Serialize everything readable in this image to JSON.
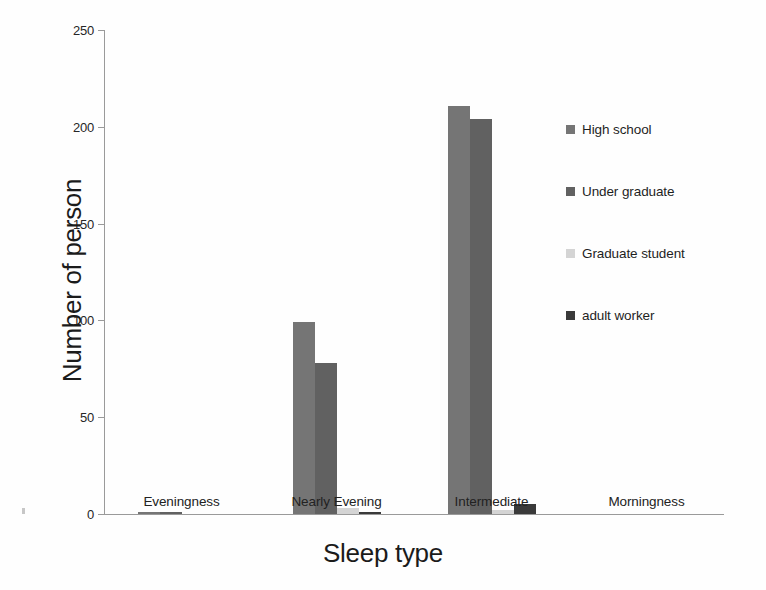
{
  "chart_data": {
    "type": "bar",
    "title": "",
    "xlabel": "Sleep type",
    "ylabel": "Number of person",
    "ylim": [
      0,
      250
    ],
    "yticks": [
      0,
      50,
      100,
      150,
      200,
      250
    ],
    "grid": false,
    "legend_position": "right",
    "categories": [
      "Eveningness",
      "Nearly Evening",
      "Intermediate",
      "Morningness"
    ],
    "series": [
      {
        "name": "High school",
        "color": "#757575",
        "values": [
          1,
          99,
          211,
          0
        ]
      },
      {
        "name": "Under graduate",
        "color": "#616161",
        "values": [
          1,
          78,
          204,
          0
        ]
      },
      {
        "name": "Graduate student",
        "color": "#d4d4d4",
        "values": [
          0,
          3,
          2,
          0
        ]
      },
      {
        "name": "adult worker",
        "color": "#3a3a3a",
        "values": [
          0,
          1,
          5,
          0
        ]
      }
    ]
  },
  "artifacts": {
    "bottom_smudge": "the next page text bleeding through the scan"
  }
}
